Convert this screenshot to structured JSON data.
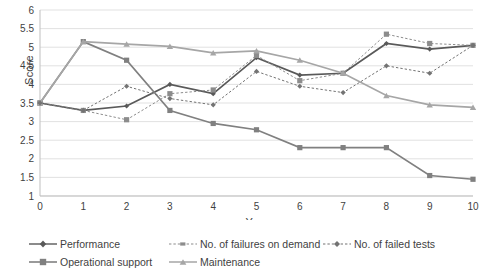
{
  "chart_data": {
    "type": "line",
    "title": "",
    "xlabel": "Year",
    "ylabel": "Score",
    "x": [
      0,
      1,
      2,
      3,
      4,
      5,
      6,
      7,
      8,
      9,
      10
    ],
    "xlim": [
      0,
      10
    ],
    "ylim": [
      1,
      6
    ],
    "ytick_step": 0.5,
    "yticks": [
      1,
      1.5,
      2,
      2.5,
      3,
      3.5,
      4,
      4.5,
      5,
      5.5,
      6
    ],
    "ytick_labels": [
      "1",
      "1.5",
      "2",
      "2.5",
      "3",
      "3.5",
      "4",
      "4.5",
      "5",
      "5.5",
      "6"
    ],
    "xticks": [
      0,
      1,
      2,
      3,
      4,
      5,
      6,
      7,
      8,
      9,
      10
    ],
    "xtick_labels": [
      "0",
      "1",
      "2",
      "3",
      "4",
      "5",
      "6",
      "7",
      "8",
      "9",
      "10"
    ],
    "grid": "horizontal",
    "legend_position": "bottom",
    "series": [
      {
        "name": "Performance",
        "color": "#595959",
        "style": "solid",
        "marker": "diamond",
        "values": [
          3.5,
          3.3,
          3.42,
          4.0,
          3.75,
          4.72,
          4.25,
          4.3,
          5.1,
          4.95,
          5.05
        ]
      },
      {
        "name": "Operational support",
        "color": "#808080",
        "style": "solid",
        "marker": "square",
        "values": [
          3.5,
          5.15,
          4.65,
          3.3,
          2.95,
          2.78,
          2.3,
          2.3,
          2.3,
          1.55,
          1.45
        ]
      },
      {
        "name": "No. of failures on demand",
        "color": "#8c8c8c",
        "style": "dotted",
        "marker": "square",
        "values": [
          3.5,
          3.3,
          3.05,
          3.75,
          3.85,
          4.78,
          4.1,
          4.3,
          5.35,
          5.1,
          5.05
        ]
      },
      {
        "name": "Maintenance",
        "color": "#a6a6a6",
        "style": "solid",
        "marker": "triangle",
        "values": [
          3.5,
          5.15,
          5.08,
          5.02,
          4.85,
          4.9,
          4.65,
          4.3,
          3.7,
          3.45,
          3.38
        ]
      },
      {
        "name": "No. of failed tests",
        "color": "#737373",
        "style": "dotted",
        "marker": "diamond",
        "values": [
          3.5,
          3.3,
          3.95,
          3.62,
          3.45,
          4.35,
          3.95,
          3.78,
          4.5,
          4.3,
          5.05
        ]
      }
    ]
  },
  "axes": {
    "ylabel": "Score",
    "xlabel": "Year"
  },
  "legend": {
    "items": [
      {
        "label": "Performance"
      },
      {
        "label": "No. of failures on demand"
      },
      {
        "label": "No. of failed tests"
      },
      {
        "label": "Operational support"
      },
      {
        "label": "Maintenance"
      }
    ]
  }
}
